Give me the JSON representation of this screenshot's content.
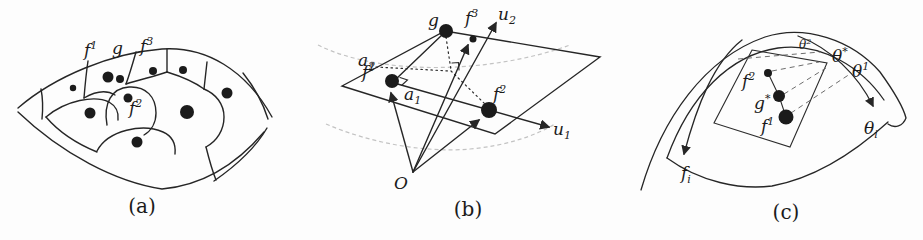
{
  "figure_caption_note": "three-panel mathematical figure",
  "panel_a": {
    "caption": "(a)",
    "labels": {
      "f1_base": "f",
      "f1_sup": "1",
      "g": "g",
      "f3_base": "f",
      "f3_sup": "3",
      "f2_base": "f",
      "f2_sup": "2"
    }
  },
  "panel_b": {
    "caption": "(b)",
    "labels": {
      "g": "g",
      "f3_base": "f",
      "f3_sup": "3",
      "u2_base": "u",
      "u2_sub": "2",
      "a2_base": "a",
      "a2_sub": "2",
      "f1_base": "f",
      "f1_sup": "1",
      "a1_base": "a",
      "a1_sub": "1",
      "f2_base": "f",
      "f2_sup": "2",
      "u1_base": "u",
      "u1_sub": "1",
      "origin": "O"
    }
  },
  "panel_c": {
    "caption": "(c)",
    "labels": {
      "theta2_base": "θ",
      "theta2_sup": "2",
      "thetastar_base": "θ",
      "thetastar_sup": "*",
      "theta1_base": "θ",
      "theta1_sup": "1",
      "f2_base": "f",
      "f2_sup": "2",
      "gstar_base": "g",
      "gstar_sup": "*",
      "f1_base": "f",
      "f1_sup": "1",
      "thetai_base": "θ",
      "thetai_sub": "i",
      "fi_base": "f",
      "fi_sub": "i"
    }
  },
  "colors": {
    "ink": "#262626",
    "dot": "#1b1b1b",
    "faint_dash": "#c3c3c3",
    "gray_dash": "#6e6e6e",
    "paper": "#fdfdfd"
  }
}
